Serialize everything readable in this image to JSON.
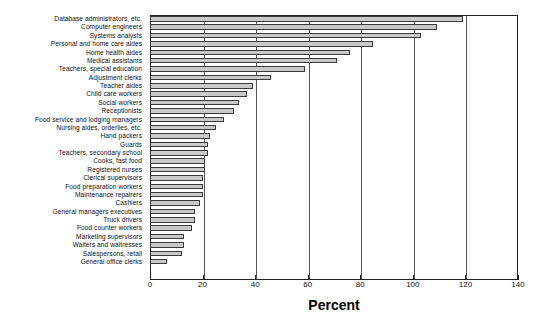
{
  "chart_data": {
    "type": "bar",
    "orientation": "horizontal",
    "title": "",
    "xlabel": "Percent",
    "ylabel": "",
    "xlim": [
      0,
      140
    ],
    "xticks": [
      0,
      20,
      40,
      60,
      80,
      100,
      120,
      140
    ],
    "grid": true,
    "legend": null,
    "categories": [
      "Database administrators, etc.",
      "Computer engineers",
      "Systems analysts",
      "Personal and home care aides",
      "Home health aides",
      "Medical assistants",
      "Teachers, special education",
      "Adjustment clerks",
      "Teacher aides",
      "Child care workers",
      "Social workers",
      "Receptionists",
      "Food service and lodging managers",
      "Nursing aides, orderlies, etc.",
      "Hand packers",
      "Guards",
      "Teachers, secondary school",
      "Cooks, fast food",
      "Registered nurses",
      "Clerical supervisors",
      "Food preparation workers",
      "Maintenance repairers",
      "Cashiers",
      "General managers executives",
      "Truck drivers",
      "Food counter workers",
      "Marketing supervisors",
      "Waiters and waitresses",
      "Salespersons, retail",
      "General office clerks"
    ],
    "values": [
      119,
      109,
      103,
      85,
      76,
      71,
      59,
      46,
      39,
      37,
      34,
      32,
      28,
      25,
      23,
      22,
      22,
      21,
      21,
      20,
      20,
      20,
      19,
      17,
      17,
      16,
      13,
      13,
      12,
      6.5
    ]
  },
  "axis": {
    "xlabel": "Percent",
    "ticks": [
      "0",
      "20",
      "40",
      "60",
      "80",
      "100",
      "120",
      "140"
    ]
  }
}
